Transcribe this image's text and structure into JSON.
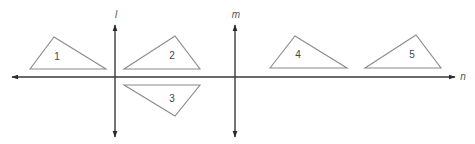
{
  "diagram": {
    "colors": {
      "axis": "#3a3a3a",
      "triangle_stroke": "#8a8a8a",
      "text": "#444444",
      "background": "#ffffff"
    },
    "lines": [
      {
        "id": "l",
        "label": "l",
        "orientation": "vertical",
        "x": 115,
        "y1": 25,
        "y2": 137,
        "label_x": 116,
        "label_y": 18
      },
      {
        "id": "m",
        "label": "m",
        "orientation": "vertical",
        "x": 235,
        "y1": 25,
        "y2": 137,
        "label_x": 236,
        "label_y": 18
      },
      {
        "id": "n",
        "label": "n",
        "orientation": "horizontal",
        "y": 77,
        "x1": 12,
        "x2": 455,
        "label_x": 463,
        "label_y": 80
      }
    ],
    "triangles": [
      {
        "label": "1",
        "points": "30,69 54,37 106,69",
        "label_x": 57,
        "label_y": 60
      },
      {
        "label": "2",
        "points": "124,69 175,36 200,69",
        "label_x": 172,
        "label_y": 59
      },
      {
        "label": "3",
        "points": "124,85 200,85 175,116",
        "label_x": 172,
        "label_y": 102
      },
      {
        "label": "4",
        "points": "270,68 295,36 347,68",
        "label_x": 298,
        "label_y": 58
      },
      {
        "label": "5",
        "points": "365,68 416,35 441,68",
        "label_x": 412,
        "label_y": 58
      }
    ]
  }
}
